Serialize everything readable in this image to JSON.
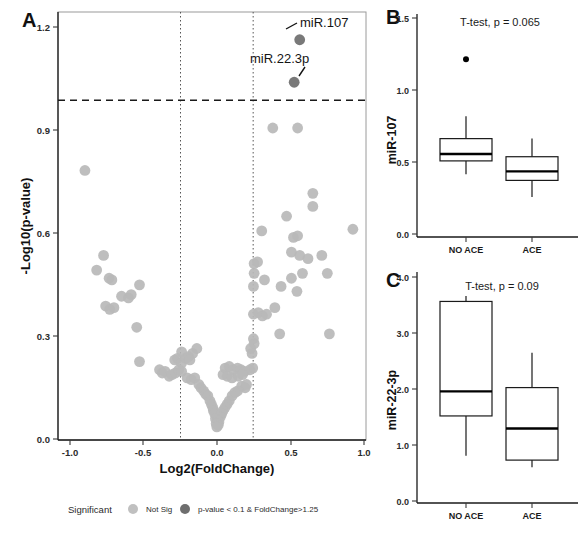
{
  "figure": {
    "panels": [
      "A",
      "B",
      "C"
    ]
  },
  "chart_data": [
    {
      "panel": "A",
      "type": "scatter",
      "title": "",
      "xlabel": "Log2(FoldChange)",
      "ylabel": "-Log10(p-value)",
      "xlim": [
        -1.15,
        1.08
      ],
      "ylim": [
        -0.04,
        1.27
      ],
      "xticks": [
        "-1.0",
        "-0.5",
        "0.0",
        "0.5",
        "1.0"
      ],
      "xtick_values": [
        -1.0,
        -0.5,
        0.0,
        0.5,
        1.0
      ],
      "yticks": [
        "0.0",
        "0.3",
        "0.6",
        "0.9",
        "1.2"
      ],
      "ytick_values": [
        0.0,
        0.3,
        0.6,
        0.9,
        1.2
      ],
      "grid": false,
      "thresholds": {
        "pvalue_line_y": 1.0,
        "foldchange_lines_x": [
          -0.263,
          0.263
        ]
      },
      "annotations": [
        {
          "text": "miR.107",
          "x": 0.6,
          "y": 1.185
        },
        {
          "text": "miR.22.3p",
          "x": 0.56,
          "y": 1.055
        }
      ],
      "series": [
        {
          "name": "p-value < 0.1 & FoldChange>1.25",
          "color": "#6e6e6e",
          "points": [
            [
              0.6,
              1.185
            ],
            [
              0.56,
              1.055
            ]
          ]
        },
        {
          "name": "Not Sig",
          "color": "#b8b8b8",
          "points": [
            [
              -0.955,
              0.785
            ],
            [
              0.405,
              0.915
            ],
            [
              0.585,
              0.915
            ],
            [
              0.695,
              0.715
            ],
            [
              0.695,
              0.675
            ],
            [
              0.505,
              0.645
            ],
            [
              0.325,
              0.6
            ],
            [
              0.555,
              0.58
            ],
            [
              0.585,
              0.585
            ],
            [
              0.985,
              0.605
            ],
            [
              0.54,
              0.535
            ],
            [
              0.6,
              0.525
            ],
            [
              0.66,
              0.515
            ],
            [
              0.76,
              0.525
            ],
            [
              -0.82,
              0.525
            ],
            [
              -0.87,
              0.48
            ],
            [
              0.27,
              0.5
            ],
            [
              0.62,
              0.47
            ],
            [
              0.8,
              0.47
            ],
            [
              0.54,
              0.455
            ],
            [
              -0.78,
              0.455
            ],
            [
              -0.76,
              0.45
            ],
            [
              -0.56,
              0.435
            ],
            [
              0.27,
              0.47
            ],
            [
              0.295,
              0.505
            ],
            [
              0.345,
              0.45
            ],
            [
              -0.69,
              0.4
            ],
            [
              -0.64,
              0.395
            ],
            [
              -0.62,
              0.405
            ],
            [
              0.265,
              0.43
            ],
            [
              0.465,
              0.43
            ],
            [
              0.58,
              0.415
            ],
            [
              -0.805,
              0.37
            ],
            [
              -0.775,
              0.36
            ],
            [
              -0.745,
              0.365
            ],
            [
              0.3,
              0.35
            ],
            [
              0.42,
              0.365
            ],
            [
              0.265,
              0.345
            ],
            [
              0.33,
              0.34
            ],
            [
              0.36,
              0.345
            ],
            [
              -0.58,
              0.305
            ],
            [
              0.455,
              0.285
            ],
            [
              0.815,
              0.285
            ],
            [
              0.265,
              0.27
            ],
            [
              0.27,
              0.255
            ],
            [
              0.245,
              0.24
            ],
            [
              0.255,
              0.225
            ],
            [
              -0.255,
              0.23
            ],
            [
              -0.175,
              0.225
            ],
            [
              -0.145,
              0.24
            ],
            [
              -0.305,
              0.205
            ],
            [
              -0.285,
              0.21
            ],
            [
              -0.255,
              0.195
            ],
            [
              -0.225,
              0.21
            ],
            [
              -0.205,
              0.215
            ],
            [
              -0.195,
              0.205
            ],
            [
              -0.56,
              0.2
            ],
            [
              0.26,
              0.18
            ],
            [
              0.24,
              0.175
            ],
            [
              -0.415,
              0.175
            ],
            [
              -0.395,
              0.165
            ],
            [
              -0.375,
              0.17
            ],
            [
              -0.345,
              0.155
            ],
            [
              -0.325,
              0.16
            ],
            [
              -0.3,
              0.165
            ],
            [
              -0.275,
              0.175
            ],
            [
              -0.255,
              0.17
            ],
            [
              0.06,
              0.18
            ],
            [
              0.09,
              0.185
            ],
            [
              0.12,
              0.175
            ],
            [
              0.15,
              0.18
            ],
            [
              0.175,
              0.175
            ],
            [
              0.2,
              0.17
            ],
            [
              0.045,
              0.16
            ],
            [
              0.075,
              0.155
            ],
            [
              0.11,
              0.15
            ],
            [
              0.155,
              0.155
            ],
            [
              0.185,
              0.16
            ],
            [
              -0.215,
              0.15
            ],
            [
              -0.185,
              0.145
            ],
            [
              -0.16,
              0.15
            ],
            [
              -0.13,
              0.13
            ],
            [
              -0.115,
              0.12
            ],
            [
              -0.095,
              0.11
            ],
            [
              -0.08,
              0.1
            ],
            [
              -0.065,
              0.095
            ],
            [
              0.205,
              0.12
            ],
            [
              0.18,
              0.125
            ],
            [
              0.215,
              0.13
            ],
            [
              0.15,
              0.11
            ],
            [
              0.13,
              0.105
            ],
            [
              0.11,
              0.095
            ],
            [
              -0.05,
              0.08
            ],
            [
              -0.04,
              0.07
            ],
            [
              -0.03,
              0.06
            ],
            [
              0.09,
              0.08
            ],
            [
              0.075,
              0.07
            ],
            [
              0.06,
              0.06
            ],
            [
              -0.025,
              0.05
            ],
            [
              -0.015,
              0.04
            ],
            [
              0.045,
              0.05
            ],
            [
              0.035,
              0.04
            ],
            [
              0.025,
              0.03
            ],
            [
              -0.01,
              0.025
            ],
            [
              0.005,
              0.02
            ],
            [
              0.015,
              0.015
            ],
            [
              -0.005,
              0.01
            ],
            [
              0.01,
              0.005
            ],
            [
              0.0,
              0.0
            ]
          ]
        }
      ],
      "legend": {
        "position": "bottom",
        "title": "Significant",
        "entries": [
          {
            "label": "Not Sig",
            "color": "#b8b8b8"
          },
          {
            "label": "p-value < 0.1 & FoldChange>1.25",
            "color": "#6e6e6e"
          }
        ]
      }
    },
    {
      "panel": "B",
      "type": "boxplot",
      "annotation": "T-test, p = 0.065",
      "ylabel": "miR-107",
      "xlabel": "",
      "ylim": [
        0.0,
        1.58
      ],
      "yticks": [
        "0.0",
        "0.5",
        "1.0",
        "1.5"
      ],
      "ytick_values": [
        0.0,
        0.5,
        1.0,
        1.5
      ],
      "categories": [
        "NO ACE",
        "ACE"
      ],
      "boxes": [
        {
          "category": "NO ACE",
          "min": 0.43,
          "q1": 0.525,
          "median": 0.575,
          "q3": 0.685,
          "max": 0.845,
          "outliers": [
            1.255
          ]
        },
        {
          "category": "ACE",
          "min": 0.265,
          "q1": 0.385,
          "median": 0.45,
          "q3": 0.555,
          "max": 0.685,
          "outliers": []
        }
      ]
    },
    {
      "panel": "C",
      "type": "boxplot",
      "annotation": "T-test, p = 0.09",
      "ylabel": "miR-22-3p",
      "xlabel": "",
      "ylim": [
        0.0,
        4.2
      ],
      "yticks": [
        "0.0",
        "1.0",
        "2.0",
        "3.0",
        "4.0"
      ],
      "ytick_values": [
        0.0,
        1.0,
        2.0,
        3.0,
        4.0
      ],
      "categories": [
        "NO ACE",
        "ACE"
      ],
      "boxes": [
        {
          "category": "NO ACE",
          "min": 0.83,
          "q1": 1.56,
          "median": 2.01,
          "q3": 3.66,
          "max": 3.76,
          "outliers": []
        },
        {
          "category": "ACE",
          "min": 0.62,
          "q1": 0.75,
          "median": 1.33,
          "q3": 2.08,
          "max": 2.72,
          "outliers": []
        }
      ]
    }
  ]
}
